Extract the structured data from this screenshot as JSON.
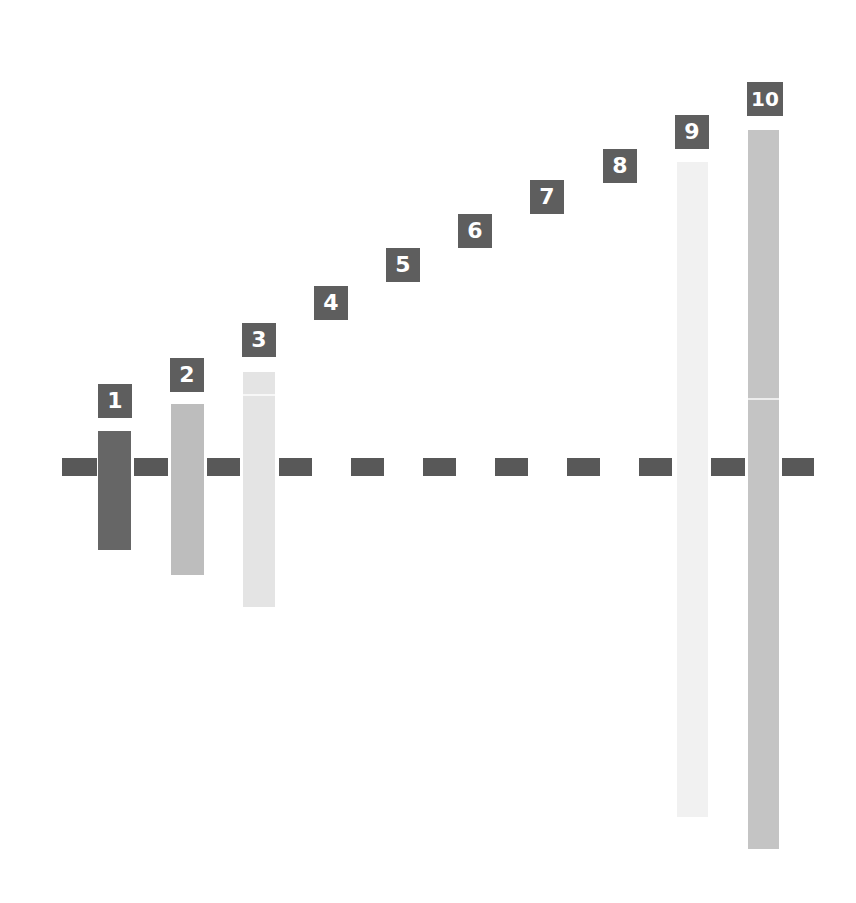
{
  "diagram": {
    "labels": [
      "1",
      "2",
      "3",
      "4",
      "5",
      "6",
      "7",
      "8",
      "9",
      "10"
    ],
    "colors": {
      "dark": "#666666",
      "mid": "#bdbdbd",
      "light": "#e4e4e4",
      "very_light": "#f1f1f1",
      "label_bg": "#5e5e5e",
      "dash": "#585858"
    }
  }
}
